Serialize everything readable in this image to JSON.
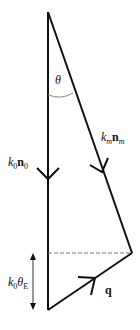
{
  "diagram": {
    "type": "vector-triangle",
    "colors": {
      "line": "#111111",
      "dashed": "#777777",
      "arc": "#777777",
      "background": "#ffffff"
    },
    "labels": {
      "theta": "θ",
      "k0_symbol": "k",
      "k0_sub": "0",
      "n0_symbol": "n",
      "n0_sub": "0",
      "km_symbol": "k",
      "km_sub": "m",
      "nm_symbol": "n",
      "nm_sub": "m",
      "kE_k": "k",
      "kE_k_sub": "0",
      "kE_theta": "θ",
      "kE_theta_sub": "E",
      "q": "q"
    },
    "vectors": [
      {
        "name": "k0n0",
        "from": [
          48,
          12
        ],
        "to": [
          48,
          310
        ],
        "direction": "down"
      },
      {
        "name": "kmnm",
        "from": [
          48,
          12
        ],
        "to": [
          132,
          253
        ],
        "direction": "down-right"
      },
      {
        "name": "q",
        "from": [
          48,
          310
        ],
        "to": [
          132,
          253
        ],
        "direction": "up-right"
      }
    ],
    "dashed_line": {
      "from": [
        48,
        253
      ],
      "to": [
        132,
        253
      ]
    },
    "dimension_arrow": {
      "x": 33,
      "from_y": 255,
      "to_y": 308,
      "label": "k0θE"
    }
  }
}
